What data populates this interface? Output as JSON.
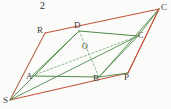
{
  "figure": {
    "number_label": "2",
    "background_color": "#fbfbfa",
    "outer_color": "#c4553a",
    "outer_color_alt": "#b5674e",
    "inner_color": "#4e8a4a",
    "dash_color": "#7aa878",
    "label_color": "#3b3b3b",
    "width": 171,
    "height": 109
  },
  "vertices": {
    "S": {
      "label": "S",
      "x": 10,
      "y": 100
    },
    "R": {
      "label": "R",
      "x": 45,
      "y": 33
    },
    "C_outer": {
      "label": "C",
      "x": 159,
      "y": 9
    },
    "P": {
      "label": "P",
      "x": 128,
      "y": 73
    },
    "A": {
      "label": "A",
      "x": 32,
      "y": 76
    },
    "D": {
      "label": "D",
      "x": 79,
      "y": 31
    },
    "C_inner": {
      "label": "C",
      "x": 138,
      "y": 36
    },
    "B": {
      "label": "B",
      "x": 99,
      "y": 77
    },
    "O": {
      "label": "O",
      "x": 87,
      "y": 52
    }
  },
  "label_positions": {
    "S": {
      "x": 3,
      "y": 96
    },
    "R": {
      "x": 37,
      "y": 26
    },
    "C_outer": {
      "x": 161,
      "y": 3
    },
    "P": {
      "x": 124,
      "y": 73
    },
    "A": {
      "x": 26,
      "y": 72
    },
    "D": {
      "x": 74,
      "y": 21
    },
    "C_inner": {
      "x": 138,
      "y": 32
    },
    "B": {
      "x": 93,
      "y": 74
    },
    "O": {
      "x": 82,
      "y": 43
    },
    "number": {
      "x": 40,
      "y": 1
    }
  },
  "edges": {
    "outer_parallelogram": [
      {
        "name": "S-R",
        "from": "S",
        "to": "R",
        "style": "solid",
        "color": "#b5674e"
      },
      {
        "name": "R-C",
        "from": "R",
        "to": "C_outer",
        "style": "solid",
        "color": "#c4553a"
      },
      {
        "name": "C-P",
        "from": "C_outer",
        "to": "P",
        "style": "solid",
        "color": "#c4553a"
      },
      {
        "name": "P-S",
        "from": "P",
        "to": "S",
        "style": "solid",
        "color": "#c4553a"
      }
    ],
    "inner_parallelogram": [
      {
        "name": "A-D",
        "from": "A",
        "to": "D",
        "style": "solid",
        "color": "#4e8a4a"
      },
      {
        "name": "D-C",
        "from": "D",
        "to": "C_inner",
        "style": "solid",
        "color": "#4e8a4a"
      },
      {
        "name": "C-B",
        "from": "C_inner",
        "to": "B",
        "style": "solid",
        "color": "#4e8a4a"
      },
      {
        "name": "B-A",
        "from": "B",
        "to": "A",
        "style": "solid",
        "color": "#4e8a4a"
      }
    ],
    "rays_from_S": [
      {
        "name": "S-A-C",
        "from": "S",
        "to": "C_inner",
        "style": "solid",
        "color": "#4e8a4a"
      },
      {
        "name": "S-D",
        "from": "S",
        "to": "D",
        "style": "solid",
        "color": "#4e8a4a"
      }
    ],
    "rays_to_Couter": [
      {
        "name": "B-Couter",
        "from": "B",
        "to": "C_outer",
        "style": "solid",
        "color": "#4e8a4a"
      },
      {
        "name": "Cinner-Couter",
        "from": "C_inner",
        "to": "C_outer",
        "style": "solid",
        "color": "#4e8a4a"
      }
    ],
    "diagonals": [
      {
        "name": "D-B",
        "from": "D",
        "to": "B",
        "style": "dashed",
        "color": "#7aa878"
      },
      {
        "name": "A-Cinner",
        "from": "A",
        "to": "C_inner",
        "style": "dashed",
        "color": "#7aa878"
      }
    ]
  }
}
